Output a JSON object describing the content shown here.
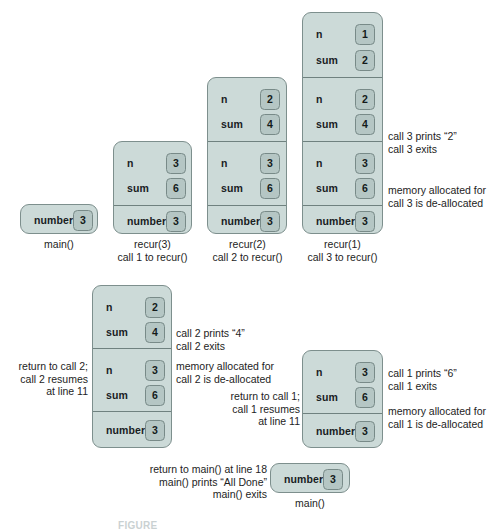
{
  "figure": {
    "caption_partial": "FIGURE"
  },
  "labels": {
    "n": "n",
    "sum": "sum",
    "number": "number",
    "main": "main()"
  },
  "top_row": {
    "frames": [
      {
        "id": "main-initial",
        "caption": "main()",
        "records": [
          {
            "vars": [
              {
                "label": "number",
                "value": "3"
              }
            ]
          }
        ]
      },
      {
        "id": "recur-3",
        "caption": "recur(3)\ncall 1 to recur()",
        "records": [
          {
            "vars": [
              {
                "label": "n",
                "value": "3"
              },
              {
                "label": "sum",
                "value": "6"
              }
            ]
          },
          {
            "vars": [
              {
                "label": "number",
                "value": "3"
              }
            ]
          }
        ]
      },
      {
        "id": "recur-2",
        "caption": "recur(2)\ncall 2 to recur()",
        "records": [
          {
            "vars": [
              {
                "label": "n",
                "value": "2"
              },
              {
                "label": "sum",
                "value": "4"
              }
            ]
          },
          {
            "vars": [
              {
                "label": "n",
                "value": "3"
              },
              {
                "label": "sum",
                "value": "6"
              }
            ]
          },
          {
            "vars": [
              {
                "label": "number",
                "value": "3"
              }
            ]
          }
        ]
      },
      {
        "id": "recur-1",
        "caption": "recur(1)\ncall 3 to recur()",
        "records": [
          {
            "vars": [
              {
                "label": "n",
                "value": "1"
              },
              {
                "label": "sum",
                "value": "2"
              }
            ]
          },
          {
            "vars": [
              {
                "label": "n",
                "value": "2"
              },
              {
                "label": "sum",
                "value": "4"
              }
            ]
          },
          {
            "vars": [
              {
                "label": "n",
                "value": "3"
              },
              {
                "label": "sum",
                "value": "6"
              }
            ]
          },
          {
            "vars": [
              {
                "label": "number",
                "value": "3"
              }
            ]
          }
        ]
      }
    ],
    "notes": {
      "call3_prints": "call 3 prints “2”\ncall 3 exits",
      "call3_dealloc": "memory allocated for\ncall 3 is de-allocated"
    }
  },
  "mid_row": {
    "frames": [
      {
        "id": "after-call3-return",
        "records": [
          {
            "vars": [
              {
                "label": "n",
                "value": "2"
              },
              {
                "label": "sum",
                "value": "4"
              }
            ]
          },
          {
            "vars": [
              {
                "label": "n",
                "value": "3"
              },
              {
                "label": "sum",
                "value": "6"
              }
            ]
          },
          {
            "vars": [
              {
                "label": "number",
                "value": "3"
              }
            ]
          }
        ]
      },
      {
        "id": "after-call2-return",
        "records": [
          {
            "vars": [
              {
                "label": "n",
                "value": "3"
              },
              {
                "label": "sum",
                "value": "6"
              }
            ]
          },
          {
            "vars": [
              {
                "label": "number",
                "value": "3"
              }
            ]
          }
        ]
      }
    ],
    "notes": {
      "return_to_call2": "return to call 2;\ncall 2 resumes\nat line 11",
      "call2_prints": "call 2 prints “4”\ncall 2 exits",
      "call2_dealloc": "memory allocated for\ncall 2 is de-allocated",
      "return_to_call1": "return to call 1;\ncall 1 resumes\nat line 11",
      "call1_prints": "call 1 prints “6”\ncall 1 exits",
      "call1_dealloc": "memory allocated for\ncall 1 is de-allocated"
    }
  },
  "bottom_row": {
    "frame": {
      "id": "main-final",
      "caption": "main()",
      "records": [
        {
          "vars": [
            {
              "label": "number",
              "value": "3"
            }
          ]
        }
      ]
    },
    "notes": {
      "return_to_main": "return to main() at line 18\nmain() prints “All Done”\nmain() exits"
    }
  },
  "colors": {
    "frame_fill": "#ccdad8",
    "frame_border": "#7d8f8d",
    "chip_fill": "#b5c6c4",
    "chip_border": "#788a88",
    "text": "#1d1d1d",
    "background": "#ffffff"
  }
}
